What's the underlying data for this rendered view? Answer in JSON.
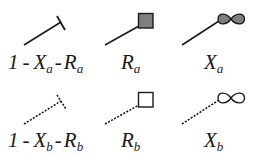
{
  "legend": {
    "colors": {
      "stroke": "#1a1a1a",
      "filled": "#7f7f7f",
      "empty": "#ffffff"
    },
    "rows": [
      {
        "series": "a",
        "line_style": "solid",
        "items": [
          {
            "symbol": "t-bar",
            "label_parts": {
              "one": "1",
              "op1": "-",
              "x": "X",
              "x_sub": "a",
              "op2": "-",
              "r": "R",
              "r_sub": "a"
            }
          },
          {
            "symbol": "filled-square",
            "label_parts": {
              "main": "R",
              "sub": "a"
            }
          },
          {
            "symbol": "filled-figure-eight",
            "label_parts": {
              "main": "X",
              "sub": "a"
            }
          }
        ]
      },
      {
        "series": "b",
        "line_style": "dashed",
        "items": [
          {
            "symbol": "dotted-t-bar",
            "label_parts": {
              "one": "1",
              "op1": "-",
              "x": "X",
              "x_sub": "b",
              "op2": "-",
              "r": "R",
              "r_sub": "b"
            }
          },
          {
            "symbol": "empty-square",
            "label_parts": {
              "main": "R",
              "sub": "b"
            }
          },
          {
            "symbol": "empty-figure-eight",
            "label_parts": {
              "main": "X",
              "sub": "b"
            }
          }
        ]
      }
    ]
  }
}
